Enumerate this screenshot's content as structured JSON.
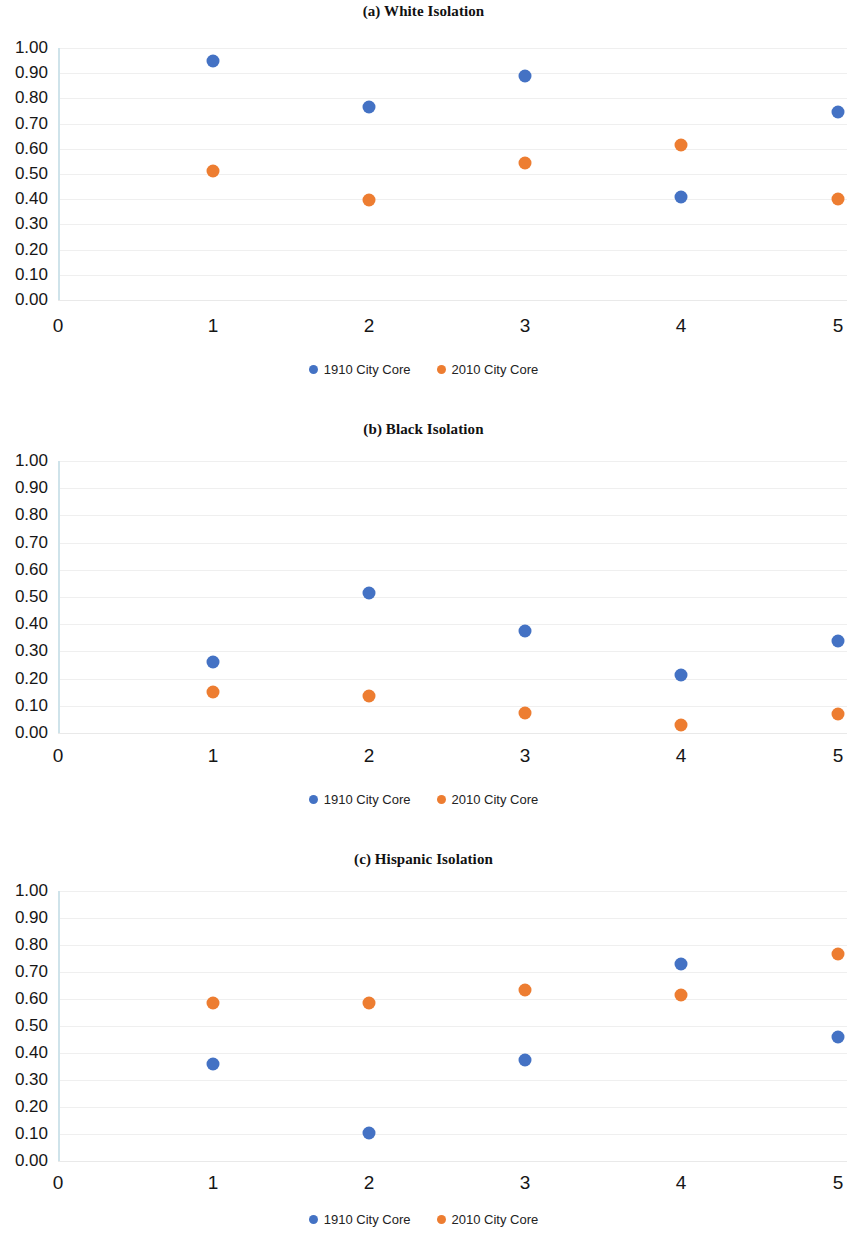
{
  "figure": {
    "series_names": [
      "1910 City Core",
      "2010 City Core"
    ],
    "colors": {
      "series1": "#4472C4",
      "series2": "#ED7D31"
    },
    "y_ticks": [
      "0.00",
      "0.10",
      "0.20",
      "0.30",
      "0.40",
      "0.50",
      "0.60",
      "0.70",
      "0.80",
      "0.90",
      "1.00"
    ],
    "x_ticks": [
      "0",
      "1",
      "2",
      "3",
      "4",
      "5"
    ]
  },
  "panels": [
    {
      "title": "(a) White Isolation"
    },
    {
      "title": "(b) Black Isolation"
    },
    {
      "title": "(c) Hispanic Isolation"
    }
  ],
  "chart_data": [
    {
      "type": "scatter",
      "title": "(a) White Isolation",
      "xlabel": "",
      "ylabel": "",
      "x": [
        1,
        2,
        3,
        4,
        5
      ],
      "xlim": [
        0,
        5
      ],
      "ylim": [
        0.0,
        1.0
      ],
      "xticks": [
        0,
        1,
        2,
        3,
        4,
        5
      ],
      "yticks": [
        0.0,
        0.1,
        0.2,
        0.3,
        0.4,
        0.5,
        0.6,
        0.7,
        0.8,
        0.9,
        1.0
      ],
      "grid": true,
      "legend_position": "bottom",
      "series": [
        {
          "name": "1910 City Core",
          "color": "#4472C4",
          "values": [
            0.95,
            0.765,
            0.89,
            0.41,
            0.745
          ]
        },
        {
          "name": "2010 City Core",
          "color": "#ED7D31",
          "values": [
            0.51,
            0.395,
            0.545,
            0.615,
            0.4
          ]
        }
      ]
    },
    {
      "type": "scatter",
      "title": "(b) Black Isolation",
      "xlabel": "",
      "ylabel": "",
      "x": [
        1,
        2,
        3,
        4,
        5
      ],
      "xlim": [
        0,
        5
      ],
      "ylim": [
        0.0,
        1.0
      ],
      "xticks": [
        0,
        1,
        2,
        3,
        4,
        5
      ],
      "yticks": [
        0.0,
        0.1,
        0.2,
        0.3,
        0.4,
        0.5,
        0.6,
        0.7,
        0.8,
        0.9,
        1.0
      ],
      "grid": true,
      "legend_position": "bottom",
      "series": [
        {
          "name": "1910 City Core",
          "color": "#4472C4",
          "values": [
            0.26,
            0.515,
            0.375,
            0.215,
            0.34
          ]
        },
        {
          "name": "2010 City Core",
          "color": "#ED7D31",
          "values": [
            0.15,
            0.135,
            0.075,
            0.03,
            0.07
          ]
        }
      ]
    },
    {
      "type": "scatter",
      "title": "(c) Hispanic Isolation",
      "xlabel": "",
      "ylabel": "",
      "x": [
        1,
        2,
        3,
        4,
        5
      ],
      "xlim": [
        0,
        5
      ],
      "ylim": [
        0.0,
        1.0
      ],
      "xticks": [
        0,
        1,
        2,
        3,
        4,
        5
      ],
      "yticks": [
        0.0,
        0.1,
        0.2,
        0.3,
        0.4,
        0.5,
        0.6,
        0.7,
        0.8,
        0.9,
        1.0
      ],
      "grid": true,
      "legend_position": "bottom",
      "series": [
        {
          "name": "1910 City Core",
          "color": "#4472C4",
          "values": [
            0.36,
            0.105,
            0.375,
            0.73,
            0.46
          ]
        },
        {
          "name": "2010 City Core",
          "color": "#ED7D31",
          "values": [
            0.585,
            0.585,
            0.635,
            0.615,
            0.765
          ]
        }
      ]
    }
  ]
}
